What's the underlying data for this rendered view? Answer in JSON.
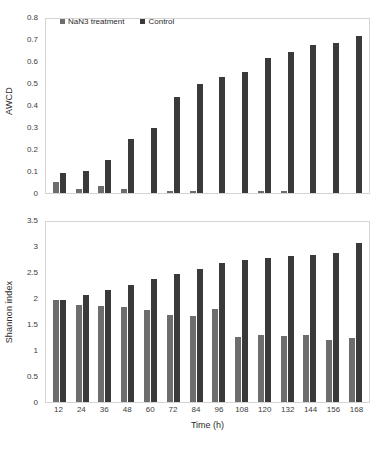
{
  "chart_data": [
    {
      "type": "bar",
      "title": "",
      "xlabel": "",
      "ylabel": "AWCD",
      "ylim": [
        0,
        0.8
      ],
      "yticks": [
        "0",
        "0.1",
        "0.2",
        "0.3",
        "0.4",
        "0.5",
        "0.6",
        "0.7",
        "0.8"
      ],
      "grid": false,
      "legend_position": "top-center",
      "categories": [
        "12",
        "24",
        "36",
        "48",
        "60",
        "72",
        "84",
        "96",
        "108",
        "120",
        "132",
        "144",
        "156",
        "168"
      ],
      "series": [
        {
          "name": "NaN3 treatment",
          "color": "#6d6d6d",
          "values": [
            0.05,
            0.02,
            0.03,
            0.02,
            0.0,
            0.01,
            0.01,
            0.0,
            0.0,
            0.01,
            0.01,
            0.0,
            0.0,
            0.0
          ]
        },
        {
          "name": "Control",
          "color": "#3a3a3a",
          "values": [
            0.09,
            0.1,
            0.15,
            0.25,
            0.3,
            0.44,
            0.5,
            0.535,
            0.555,
            0.62,
            0.65,
            0.68,
            0.69,
            0.72
          ]
        }
      ]
    },
    {
      "type": "bar",
      "title": "",
      "xlabel": "Time (h)",
      "ylabel": "Shannon index",
      "ylim": [
        0,
        3.5
      ],
      "yticks": [
        "0",
        "0.5",
        "1",
        "1.5",
        "2",
        "2.5",
        "3",
        "3.5"
      ],
      "grid": false,
      "legend_position": "none",
      "categories": [
        "12",
        "24",
        "36",
        "48",
        "60",
        "72",
        "84",
        "96",
        "108",
        "120",
        "132",
        "144",
        "156",
        "168"
      ],
      "series": [
        {
          "name": "NaN3 treatment",
          "color": "#6d6d6d",
          "values": [
            1.98,
            1.89,
            1.86,
            1.84,
            1.78,
            1.7,
            1.67,
            1.81,
            1.26,
            1.31,
            1.29,
            1.3,
            1.2,
            1.24
          ]
        },
        {
          "name": "Control",
          "color": "#3a3a3a",
          "values": [
            1.98,
            2.08,
            2.18,
            2.28,
            2.4,
            2.49,
            2.59,
            2.7,
            2.76,
            2.8,
            2.84,
            2.86,
            2.9,
            3.1
          ]
        }
      ]
    }
  ],
  "legend": {
    "items": [
      {
        "label": "NaN3 treatment",
        "color": "#6d6d6d"
      },
      {
        "label": "Control",
        "color": "#3a3a3a"
      }
    ]
  },
  "axes": {
    "awcd_ylabel": "AWCD",
    "shannon_ylabel": "Shannon index",
    "xlabel": "Time (h)"
  }
}
